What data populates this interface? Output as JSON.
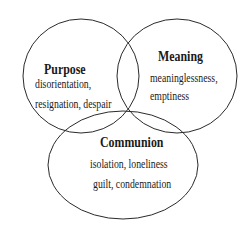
{
  "diagram": {
    "type": "venn",
    "stroke_color": "#2a2a2a",
    "circles": [
      {
        "id": "purpose",
        "title": "Purpose",
        "items": [
          "disorientation,",
          "resignation, despair"
        ]
      },
      {
        "id": "meaning",
        "title": "Meaning",
        "items": [
          "meaninglessness,",
          "emptiness"
        ]
      },
      {
        "id": "communion",
        "title": "Communion",
        "items": [
          "isolation, loneliness",
          "guilt, condemnation"
        ]
      }
    ]
  }
}
